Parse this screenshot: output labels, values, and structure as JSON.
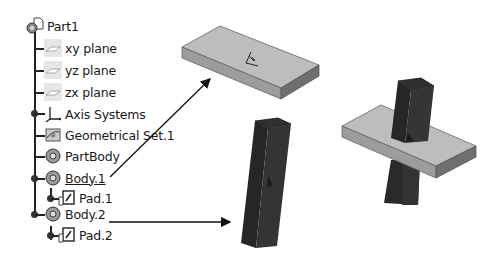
{
  "tree": {
    "root": {
      "label": "Part1",
      "icon": "part-icon"
    },
    "items": [
      {
        "label": "xy plane",
        "icon": "plane-icon",
        "level": 1
      },
      {
        "label": "yz plane",
        "icon": "plane-icon",
        "level": 1
      },
      {
        "label": "zx plane",
        "icon": "plane-icon",
        "level": 1
      },
      {
        "label": "Axis Systems",
        "icon": "axis-system-icon",
        "level": 1,
        "expandable": true
      },
      {
        "label": "Geometrical Set.1",
        "icon": "geometrical-set-icon",
        "level": 1
      },
      {
        "label": "PartBody",
        "icon": "body-icon",
        "level": 1
      },
      {
        "label": "Body.1",
        "icon": "body-icon",
        "level": 1,
        "expandable": true,
        "underlined": true
      },
      {
        "label": "Pad.1",
        "icon": "pad-icon",
        "level": 2,
        "expandable": true
      },
      {
        "label": "Body.2",
        "icon": "body-icon",
        "level": 1,
        "expandable": true
      },
      {
        "label": "Pad.2",
        "icon": "pad-icon",
        "level": 2,
        "expandable": true
      }
    ]
  },
  "shapes": {
    "plate": {
      "name": "Body.1 (Pad.1) plate",
      "top_color": "#bdbdbd",
      "side_color": "#8e8e8e",
      "edge_color": "#5a5a5a"
    },
    "prism": {
      "name": "Body.2 (Pad.2) prism",
      "color": "#2a2a2a",
      "face_dark": "#1c1c1c",
      "face_light": "#353535"
    },
    "assembly": {
      "name": "combined result"
    }
  },
  "arrows": [
    {
      "from": "Body.1",
      "to": "plate"
    },
    {
      "from": "Body.2",
      "to": "prism"
    }
  ]
}
